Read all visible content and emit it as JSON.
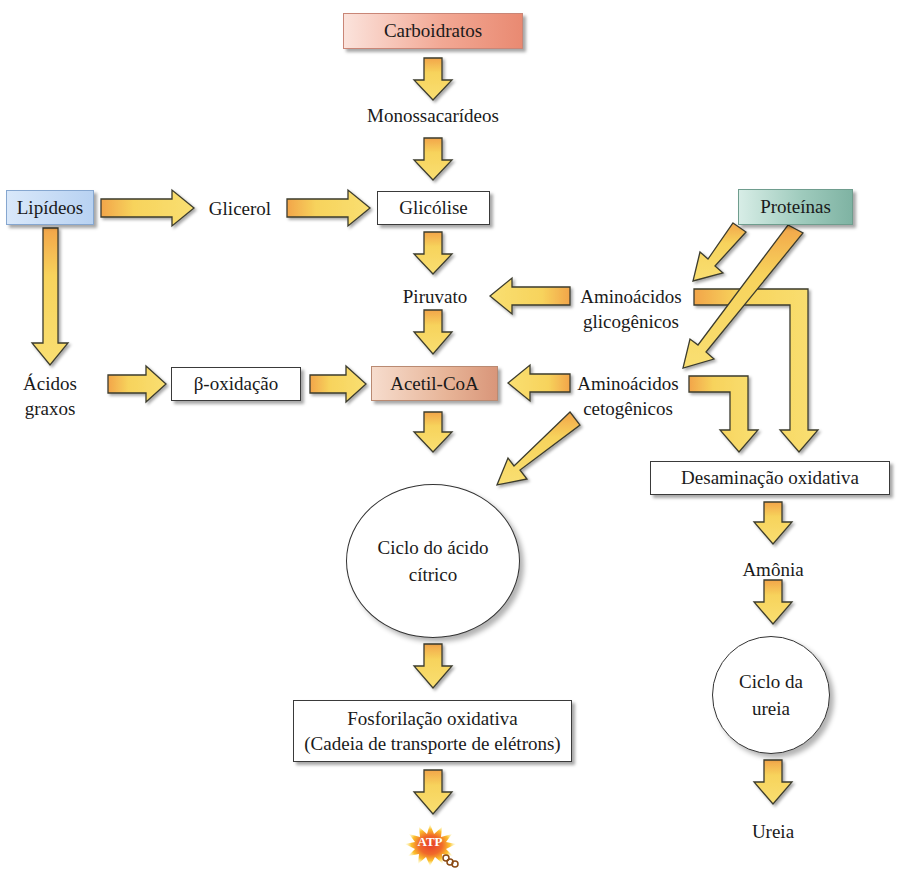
{
  "diagram": {
    "nodes": {
      "carboidratos": "Carboidratos",
      "monossacarideos": "Monossacarídeos",
      "lipideos": "Lipídeos",
      "glicerol": "Glicerol",
      "glicolise": "Glicólise",
      "proteinas": "Proteínas",
      "piruvato": "Piruvato",
      "aminoacidos_glicogenicos_1": "Aminoácidos",
      "aminoacidos_glicogenicos_2": "glicogênicos",
      "acidos_graxos_1": "Ácidos",
      "acidos_graxos_2": "graxos",
      "beta_oxidacao": "β-oxidação",
      "acetil_coa": "Acetil-CoA",
      "aminoacidos_cetogenicos_1": "Aminoácidos",
      "aminoacidos_cetogenicos_2": "cetogênicos",
      "desaminacao": "Desaminação oxidativa",
      "ciclo_acido_citrico_1": "Ciclo do ácido",
      "ciclo_acido_citrico_2": "cítrico",
      "amonia": "Amônia",
      "ciclo_ureia_1": "Ciclo da",
      "ciclo_ureia_2": "ureia",
      "fosforilacao_1": "Fosforilação oxidativa",
      "fosforilacao_2": "(Cadeia de transporte de elétrons)",
      "ureia": "Ureia",
      "atp": "ATP"
    },
    "edges": [
      {
        "from": "Carboidratos",
        "to": "Monossacarídeos"
      },
      {
        "from": "Monossacarídeos",
        "to": "Glicólise"
      },
      {
        "from": "Lipídeos",
        "to": "Glicerol"
      },
      {
        "from": "Glicerol",
        "to": "Glicólise"
      },
      {
        "from": "Lipídeos",
        "to": "Ácidos graxos"
      },
      {
        "from": "Glicólise",
        "to": "Piruvato"
      },
      {
        "from": "Proteínas",
        "to": "Aminoácidos glicogênicos"
      },
      {
        "from": "Proteínas",
        "to": "Aminoácidos cetogênicos"
      },
      {
        "from": "Aminoácidos glicogênicos",
        "to": "Piruvato"
      },
      {
        "from": "Aminoácidos glicogênicos",
        "to": "Desaminação oxidativa"
      },
      {
        "from": "Piruvato",
        "to": "Acetil-CoA"
      },
      {
        "from": "Ácidos graxos",
        "to": "β-oxidação"
      },
      {
        "from": "β-oxidação",
        "to": "Acetil-CoA"
      },
      {
        "from": "Aminoácidos cetogênicos",
        "to": "Acetil-CoA"
      },
      {
        "from": "Aminoácidos cetogênicos",
        "to": "Ciclo do ácido cítrico"
      },
      {
        "from": "Aminoácidos cetogênicos",
        "to": "Desaminação oxidativa"
      },
      {
        "from": "Acetil-CoA",
        "to": "Ciclo do ácido cítrico"
      },
      {
        "from": "Ciclo do ácido cítrico",
        "to": "Fosforilação oxidativa"
      },
      {
        "from": "Fosforilação oxidativa",
        "to": "ATP"
      },
      {
        "from": "Desaminação oxidativa",
        "to": "Amônia"
      },
      {
        "from": "Amônia",
        "to": "Ciclo da ureia"
      },
      {
        "from": "Ciclo da ureia",
        "to": "Ureia"
      }
    ],
    "colors": {
      "arrow_fill": "#f7d35c",
      "arrow_fill_top": "#f2a54a",
      "arrow_stroke": "#3c3c2e",
      "carboidratos": "#ee9a82",
      "lipideos": "#b8d2f2",
      "proteinas": "#8fbfb0",
      "acetil_coa": "#e2a88a"
    }
  }
}
